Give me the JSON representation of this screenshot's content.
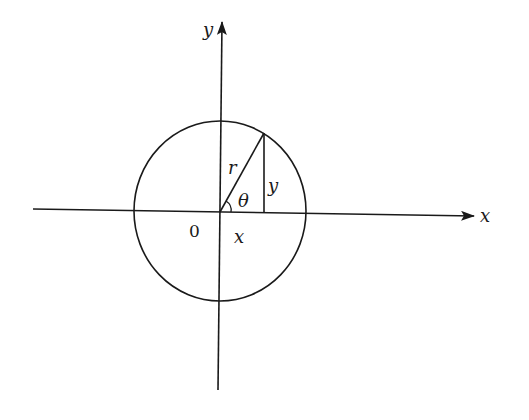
{
  "diagram": {
    "type": "unit-circle-polar-coordinates",
    "stroke_color": "#1a1a1a",
    "background": "#ffffff",
    "axes": {
      "x_axis": {
        "label": "x",
        "from": [
          33,
          211
        ],
        "to": [
          474,
          216
        ]
      },
      "y_axis": {
        "label": "y",
        "from": [
          218,
          390
        ],
        "to": [
          222,
          22
        ]
      },
      "origin_label": "0"
    },
    "circle": {
      "center": [
        219,
        211
      ],
      "radius": 87
    },
    "point": {
      "x": 264,
      "y": 133
    },
    "segments": {
      "radius_label": "r",
      "vertical_label": "y",
      "horizontal_label": "x",
      "angle_label": "θ"
    }
  }
}
